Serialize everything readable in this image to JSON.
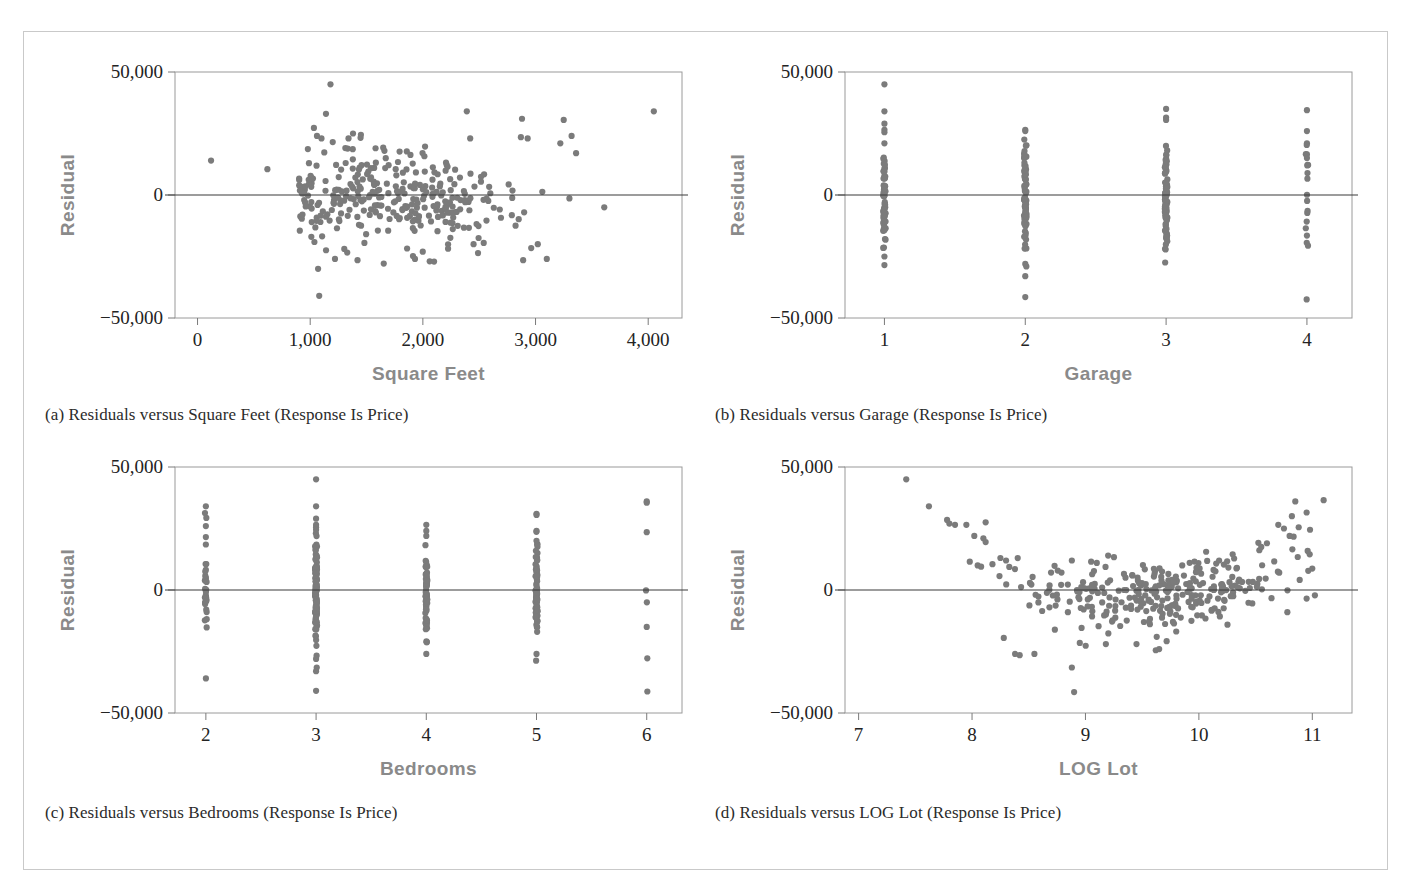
{
  "figure": {
    "border_color": "#c9c9c9",
    "dot_color": "#7b7b7b",
    "axis_title_color": "#8a8a8a",
    "tick_label_color": "#232323"
  },
  "panels": [
    {
      "key": "a",
      "caption": "(a) Residuals versus Square Feet (Response Is Price)",
      "chart_data": {
        "type": "scatter",
        "title": "",
        "xlabel": "Square Feet",
        "ylabel": "Residual",
        "xlim": [
          -200,
          4300
        ],
        "ylim": [
          -50000,
          50000
        ],
        "xticks": [
          0,
          1000,
          2000,
          3000,
          4000
        ],
        "xticklabels": [
          "0",
          "1,000",
          "2,000",
          "3,000",
          "4,000"
        ],
        "yticks": [
          -50000,
          0,
          50000
        ],
        "yticklabels": [
          "−50,000",
          "0",
          "50,000"
        ],
        "grid": false,
        "legend": "none",
        "reference_line_y": 0,
        "mode": "cloud",
        "n_points": 310,
        "seed": 1234,
        "x_center": 1750,
        "x_spread": 560,
        "x_min_clip": 900,
        "x_max_clip": 3450,
        "y_spread": 9000,
        "outliers": [
          [
            120,
            14000
          ],
          [
            620,
            10500
          ],
          [
            1180,
            45000
          ],
          [
            1140,
            33000
          ],
          [
            1060,
            24000
          ],
          [
            1100,
            23000
          ],
          [
            1200,
            21500
          ],
          [
            1340,
            23000
          ],
          [
            1380,
            25000
          ],
          [
            1450,
            24500
          ],
          [
            1580,
            19000
          ],
          [
            2390,
            34000
          ],
          [
            2420,
            23000
          ],
          [
            2880,
            31000
          ],
          [
            2870,
            23500
          ],
          [
            2930,
            23000
          ],
          [
            3250,
            30500
          ],
          [
            3220,
            21000
          ],
          [
            3320,
            24000
          ],
          [
            3360,
            17000
          ],
          [
            4050,
            34000
          ],
          [
            1080,
            -41000
          ],
          [
            1070,
            -30000
          ],
          [
            1220,
            -26000
          ],
          [
            1420,
            -26500
          ],
          [
            1930,
            -26000
          ],
          [
            2890,
            -26500
          ],
          [
            3100,
            -26000
          ],
          [
            3610,
            -5000
          ],
          [
            1010,
            -17000
          ],
          [
            3020,
            -20000
          ],
          [
            2540,
            -19500
          ],
          [
            2450,
            -20000
          ]
        ]
      }
    },
    {
      "key": "b",
      "caption": "(b) Residuals versus Garage (Response Is Price)",
      "chart_data": {
        "type": "scatter",
        "title": "",
        "xlabel": "Garage",
        "ylabel": "Residual",
        "xlim": [
          0.72,
          4.32
        ],
        "ylim": [
          -50000,
          50000
        ],
        "xticks": [
          1,
          2,
          3,
          4
        ],
        "xticklabels": [
          "1",
          "2",
          "3",
          "4"
        ],
        "yticks": [
          -50000,
          0,
          50000
        ],
        "yticklabels": [
          "−50,000",
          "0",
          "50,000"
        ],
        "grid": false,
        "legend": "none",
        "reference_line_y": 0,
        "mode": "strip",
        "seed": 77,
        "categories": [
          1,
          2,
          3,
          4
        ],
        "counts": [
          62,
          78,
          96,
          16
        ],
        "cat_spread": [
          9500,
          11500,
          10500,
          14000
        ],
        "cat_outliers": [
          [
            1,
            45000
          ],
          [
            1,
            34000
          ],
          [
            1,
            29000
          ],
          [
            1,
            26500
          ],
          [
            1,
            25500
          ],
          [
            1,
            21000
          ],
          [
            1,
            -25000
          ],
          [
            1,
            -28500
          ],
          [
            2,
            26500
          ],
          [
            2,
            26000
          ],
          [
            2,
            -28000
          ],
          [
            2,
            -33000
          ],
          [
            2,
            -41500
          ],
          [
            3,
            35000
          ],
          [
            3,
            31500
          ],
          [
            3,
            30500
          ],
          [
            4,
            34500
          ],
          [
            4,
            26000
          ],
          [
            4,
            21000
          ],
          [
            4,
            16500
          ],
          [
            4,
            15000
          ],
          [
            4,
            -16500
          ]
        ]
      }
    },
    {
      "key": "c",
      "caption": "(c) Residuals versus Bedrooms (Response Is Price)",
      "chart_data": {
        "type": "scatter",
        "title": "",
        "xlabel": "Bedrooms",
        "ylabel": "Residual",
        "xlim": [
          1.72,
          6.32
        ],
        "ylim": [
          -50000,
          50000
        ],
        "xticks": [
          2,
          3,
          4,
          5,
          6
        ],
        "xticklabels": [
          "2",
          "3",
          "4",
          "5",
          "6"
        ],
        "yticks": [
          -50000,
          0,
          50000
        ],
        "yticklabels": [
          "−50,000",
          "0",
          "50,000"
        ],
        "grid": false,
        "legend": "none",
        "reference_line_y": 0,
        "mode": "strip",
        "seed": 910,
        "categories": [
          2,
          3,
          4,
          5,
          6
        ],
        "counts": [
          30,
          110,
          64,
          70,
          4
        ],
        "cat_spread": [
          10500,
          11500,
          9500,
          10500,
          16000
        ],
        "cat_outliers": [
          [
            2,
            34000
          ],
          [
            2,
            26000
          ],
          [
            2,
            21500
          ],
          [
            2,
            18500
          ],
          [
            3,
            45000
          ],
          [
            3,
            34000
          ],
          [
            3,
            29000
          ],
          [
            3,
            25500
          ],
          [
            3,
            24500
          ],
          [
            3,
            -33000
          ],
          [
            3,
            -41000
          ],
          [
            3,
            -28000
          ],
          [
            4,
            26500
          ],
          [
            4,
            24000
          ],
          [
            4,
            22000
          ],
          [
            4,
            -26000
          ],
          [
            5,
            31000
          ],
          [
            5,
            30500
          ],
          [
            5,
            24000
          ],
          [
            5,
            20000
          ],
          [
            5,
            -26000
          ],
          [
            6,
            36000
          ],
          [
            6,
            35500
          ],
          [
            6,
            23500
          ],
          [
            6,
            -15000
          ]
        ]
      }
    },
    {
      "key": "d",
      "caption": "(d) Residuals versus LOG Lot (Response Is Price)",
      "chart_data": {
        "type": "scatter",
        "title": "",
        "xlabel": "LOG Lot",
        "ylabel": "Residual",
        "xlim": [
          6.88,
          11.35
        ],
        "ylim": [
          -50000,
          50000
        ],
        "xticks": [
          7,
          8,
          9,
          10,
          11
        ],
        "xticklabels": [
          "7",
          "8",
          "9",
          "10",
          "11"
        ],
        "yticks": [
          -50000,
          0,
          50000
        ],
        "yticklabels": [
          "−50,000",
          "0",
          "50,000"
        ],
        "grid": false,
        "legend": "none",
        "reference_line_y": 0,
        "mode": "curve",
        "n_points": 300,
        "seed": 4242,
        "x_center": 9.7,
        "x_spread": 0.62,
        "x_min_clip": 8.15,
        "x_max_clip": 11.15,
        "curve_a": 5200,
        "curve_vertex": 9.45,
        "y_spread": 7200,
        "outliers": [
          [
            7.42,
            45000
          ],
          [
            7.62,
            34000
          ],
          [
            7.78,
            28500
          ],
          [
            7.8,
            27000
          ],
          [
            7.85,
            26500
          ],
          [
            7.95,
            26500
          ],
          [
            8.12,
            27500
          ],
          [
            8.02,
            22000
          ],
          [
            8.1,
            21000
          ],
          [
            8.12,
            19500
          ],
          [
            7.98,
            11500
          ],
          [
            8.05,
            10000
          ],
          [
            8.08,
            9500
          ],
          [
            8.18,
            10500
          ],
          [
            8.25,
            13000
          ],
          [
            8.3,
            12000
          ],
          [
            8.88,
            12000
          ],
          [
            9.2,
            14000
          ],
          [
            9.05,
            11500
          ],
          [
            9.1,
            11000
          ],
          [
            10.85,
            36000
          ],
          [
            11.1,
            36500
          ],
          [
            10.95,
            31500
          ],
          [
            10.82,
            30000
          ],
          [
            10.7,
            26500
          ],
          [
            10.75,
            25000
          ],
          [
            10.88,
            25500
          ],
          [
            10.98,
            24500
          ],
          [
            10.8,
            22000
          ],
          [
            10.6,
            19000
          ],
          [
            10.55,
            17500
          ],
          [
            8.38,
            -26000
          ],
          [
            8.42,
            -26500
          ],
          [
            8.55,
            -26000
          ],
          [
            8.88,
            -31500
          ],
          [
            8.9,
            -41500
          ],
          [
            8.28,
            -19500
          ],
          [
            8.95,
            -21500
          ],
          [
            9.62,
            -24500
          ],
          [
            9.65,
            -24000
          ],
          [
            9.45,
            -22000
          ],
          [
            9.18,
            -22000
          ],
          [
            10.78,
            -9000
          ],
          [
            10.95,
            -3500
          ]
        ]
      }
    }
  ]
}
